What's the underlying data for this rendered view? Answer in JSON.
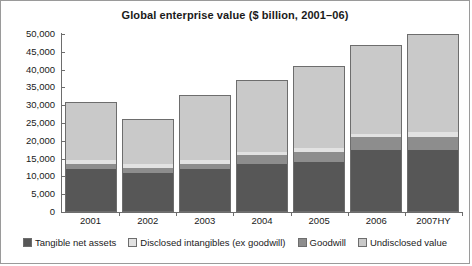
{
  "chart_data": {
    "type": "bar",
    "title": "Global enterprise value ($ billion, 2001–06)",
    "xlabel": "",
    "ylabel": "",
    "stacked": true,
    "grid": false,
    "legend_position": "bottom",
    "ylim": [
      0,
      50000
    ],
    "ytick_labels": [
      "50,000",
      "45,000",
      "40,000",
      "35,000",
      "30,000",
      "25,000",
      "20,000",
      "15,000",
      "10,000",
      "5,000",
      "0"
    ],
    "ytick_values": [
      50000,
      45000,
      40000,
      35000,
      30000,
      25000,
      20000,
      15000,
      10000,
      5000,
      0
    ],
    "categories": [
      "2001",
      "2002",
      "2003",
      "2004",
      "2005",
      "2006",
      "2007HY"
    ],
    "series": [
      {
        "name": "Tangible net assets",
        "color": "#575757",
        "values": [
          12000,
          11000,
          12000,
          13500,
          14000,
          17500,
          17500
        ]
      },
      {
        "name": "Disclosed intangibles (ex goodwill)",
        "color": "#e2e2e2",
        "values": [
          1000,
          1000,
          1000,
          1000,
          1000,
          1000,
          1500
        ]
      },
      {
        "name": "Goodwill",
        "color": "#8d8d8d",
        "values": [
          1500,
          1500,
          1500,
          2500,
          3000,
          3500,
          3500
        ]
      },
      {
        "name": "Undisclosed value",
        "color": "#c9c9c9",
        "values": [
          16500,
          12500,
          18500,
          20000,
          23000,
          25000,
          27500
        ]
      }
    ],
    "totals": [
      31000,
      26000,
      33000,
      37000,
      41000,
      47000,
      50000
    ]
  }
}
